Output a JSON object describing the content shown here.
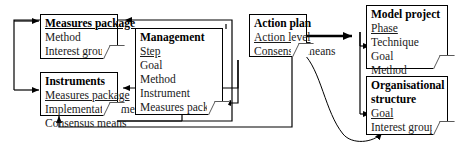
{
  "diagram": {
    "type": "flow-diagram",
    "notes": [
      {
        "id": "measures-package",
        "heading": "Measures package",
        "heading_style": "bold-underline",
        "lines": [
          "Method",
          "Interest groups"
        ]
      },
      {
        "id": "instruments",
        "heading": "Instruments",
        "heading_style": "bold",
        "lines": [
          "Measures package",
          "Implementation means",
          "Consensus means"
        ],
        "underlined_lines": [
          "Measures package"
        ]
      },
      {
        "id": "management",
        "heading": "Management",
        "heading_style": "bold",
        "lines": [
          "Step",
          "Goal",
          "Method",
          "Instrument",
          "Measures package"
        ],
        "underlined_lines": [
          "Step"
        ]
      },
      {
        "id": "action-plan",
        "heading": "Action plan",
        "heading_style": "bold",
        "lines": [
          "Action level",
          "Consensus means"
        ],
        "underlined_lines": [
          "Action level"
        ]
      },
      {
        "id": "model-project",
        "heading": "Model project",
        "heading_style": "bold",
        "lines": [
          "Phase",
          "Technique",
          "Goal",
          "Method"
        ],
        "underlined_lines": [
          "Phase"
        ]
      },
      {
        "id": "organisational-structure",
        "heading": "Organisational structure",
        "heading_line_1": "Organisational",
        "heading_line_2": "structure",
        "heading_style": "bold",
        "lines": [
          "Goal",
          "Interest groups"
        ],
        "underlined_lines": [
          "Goal"
        ]
      }
    ],
    "colors": {
      "stroke": "#000000",
      "note_fill": "#ffffff",
      "text": "#1a1a1a",
      "fold_stroke": "#5a5a5a"
    },
    "connectors": [
      {
        "from": "management",
        "to": "measures-package",
        "label": "Management to Measures package (top route)"
      },
      {
        "from": "management",
        "to": "instruments",
        "label": "Management to Instruments Measures package"
      },
      {
        "from": "action-plan",
        "to": "management",
        "label": "Action plan to Management Measures package"
      },
      {
        "from": "instruments",
        "to": "management",
        "label": "Instruments to Management Measures package"
      },
      {
        "from": "action-plan",
        "to": "instruments",
        "label": "Action plan to Instruments (bottom route)"
      },
      {
        "from": "measures-package",
        "to": "instruments",
        "label": "left spine feeding both left notes"
      },
      {
        "from": "action-plan",
        "to": "model-project",
        "label": "Action plan to Model project Technique"
      },
      {
        "from": "model-project",
        "to": "organisational-structure",
        "label": "Goal spine to both right notes"
      },
      {
        "from": "action-plan",
        "to": "organisational-structure",
        "label": "Action plan curve to Organisational structure"
      }
    ]
  }
}
